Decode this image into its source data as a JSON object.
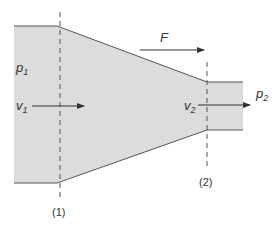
{
  "diagram": {
    "colors": {
      "fluid_fill": "#dcdcdc",
      "wall_stroke": "#555555",
      "arrow": "#333333",
      "dashed": "#555555"
    },
    "labels": {
      "p1": "p",
      "p1_sub": "1",
      "v1": "v",
      "v1_sub": "1",
      "F": "F",
      "v2": "v",
      "v2_sub": "2",
      "p2": "p",
      "p2_sub": "2",
      "section1": "(1)",
      "section2": "(2)"
    }
  }
}
